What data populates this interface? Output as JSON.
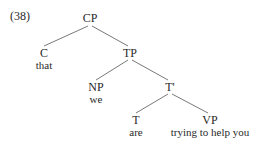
{
  "example_number": "(38)",
  "tree": {
    "root": "CP",
    "nodes": {
      "cp": {
        "label": "CP"
      },
      "c": {
        "label": "C",
        "word": "that"
      },
      "tp": {
        "label": "TP"
      },
      "np": {
        "label": "NP",
        "word": "we"
      },
      "tbar": {
        "label": "T'"
      },
      "t": {
        "label": "T",
        "word": "are"
      },
      "vp": {
        "label": "VP",
        "word": "trying to help you"
      }
    },
    "edges": [
      [
        "CP",
        "C"
      ],
      [
        "CP",
        "TP"
      ],
      [
        "TP",
        "NP"
      ],
      [
        "TP",
        "T'"
      ],
      [
        "T'",
        "T"
      ],
      [
        "T'",
        "VP"
      ]
    ]
  }
}
